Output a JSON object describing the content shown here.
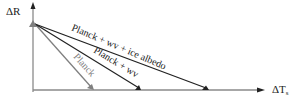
{
  "axes": {
    "y_label": "ΔR",
    "x_label_main": "ΔT",
    "x_label_sub": "s"
  },
  "lines": [
    {
      "label": "Planck",
      "color": "#808080"
    },
    {
      "label": "Planck + wv",
      "color": "#222222"
    },
    {
      "label": "Planck + wv + ice albedo",
      "color": "#222222"
    }
  ],
  "colors": {
    "axis": "#8a8a8a",
    "dark": "#222222",
    "gray": "#808080"
  }
}
